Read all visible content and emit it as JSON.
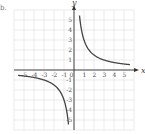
{
  "part_label": "b.",
  "chart_data": {
    "type": "line",
    "title": "",
    "function": "y = 3/x",
    "xlabel": "x",
    "ylabel": "y",
    "xlim": [
      -6,
      6
    ],
    "ylim": [
      -6,
      6
    ],
    "grid": true,
    "x_ticks": [
      "-5",
      "-4",
      "-3",
      "-2",
      "-1",
      "0",
      "1",
      "2",
      "3",
      "4",
      "5"
    ],
    "y_ticks": [
      "5",
      "4",
      "3",
      "2",
      "1",
      "-1",
      "-2",
      "-3",
      "-4",
      "-5"
    ],
    "series": [
      {
        "name": "branch-positive",
        "x": [
          0.6,
          0.75,
          1,
          1.5,
          2,
          3,
          4,
          5,
          5.5
        ],
        "y": [
          5,
          4,
          3,
          2,
          1.5,
          1,
          0.75,
          0.6,
          0.55
        ]
      },
      {
        "name": "branch-negative",
        "x": [
          -5.5,
          -5,
          -4,
          -3,
          -2,
          -1.5,
          -1,
          -0.75,
          -0.6
        ],
        "y": [
          -0.55,
          -0.6,
          -0.75,
          -1,
          -1.5,
          -2,
          -3,
          -4,
          -5
        ]
      }
    ],
    "colors": {
      "curve": "#444444",
      "grid": "#dddddd",
      "axis": "#333333"
    }
  }
}
